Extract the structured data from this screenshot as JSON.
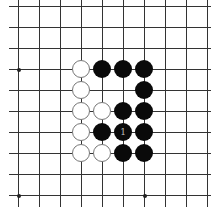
{
  "board": {
    "grid": {
      "columns_x": [
        18,
        39,
        60,
        81,
        102,
        123,
        144,
        165,
        186,
        207
      ],
      "rows_y": [
        6,
        27,
        48,
        69,
        90,
        111,
        132,
        153,
        174,
        195
      ],
      "line_x_start": 9,
      "line_x_end": 211,
      "line_y_start": 0,
      "line_y_end": 207,
      "line_color": "#333333"
    },
    "star_points": [
      {
        "col": 0,
        "row": 3
      },
      {
        "col": 0,
        "row": 9
      },
      {
        "col": 6,
        "row": 9
      }
    ],
    "stones": [
      {
        "color": "white",
        "col": 3,
        "row": 3,
        "label": ""
      },
      {
        "color": "black",
        "col": 4,
        "row": 3,
        "label": ""
      },
      {
        "color": "black",
        "col": 5,
        "row": 3,
        "label": ""
      },
      {
        "color": "black",
        "col": 6,
        "row": 3,
        "label": ""
      },
      {
        "color": "white",
        "col": 3,
        "row": 4,
        "label": ""
      },
      {
        "color": "black",
        "col": 6,
        "row": 4,
        "label": ""
      },
      {
        "color": "white",
        "col": 3,
        "row": 5,
        "label": ""
      },
      {
        "color": "white",
        "col": 4,
        "row": 5,
        "label": ""
      },
      {
        "color": "black",
        "col": 5,
        "row": 5,
        "label": ""
      },
      {
        "color": "black",
        "col": 6,
        "row": 5,
        "label": ""
      },
      {
        "color": "white",
        "col": 3,
        "row": 6,
        "label": ""
      },
      {
        "color": "black",
        "col": 4,
        "row": 6,
        "label": ""
      },
      {
        "color": "black",
        "col": 5,
        "row": 6,
        "label": "1"
      },
      {
        "color": "black",
        "col": 6,
        "row": 6,
        "label": ""
      },
      {
        "color": "white",
        "col": 3,
        "row": 7,
        "label": ""
      },
      {
        "color": "white",
        "col": 4,
        "row": 7,
        "label": ""
      },
      {
        "color": "black",
        "col": 5,
        "row": 7,
        "label": ""
      },
      {
        "color": "black",
        "col": 6,
        "row": 7,
        "label": ""
      }
    ]
  }
}
